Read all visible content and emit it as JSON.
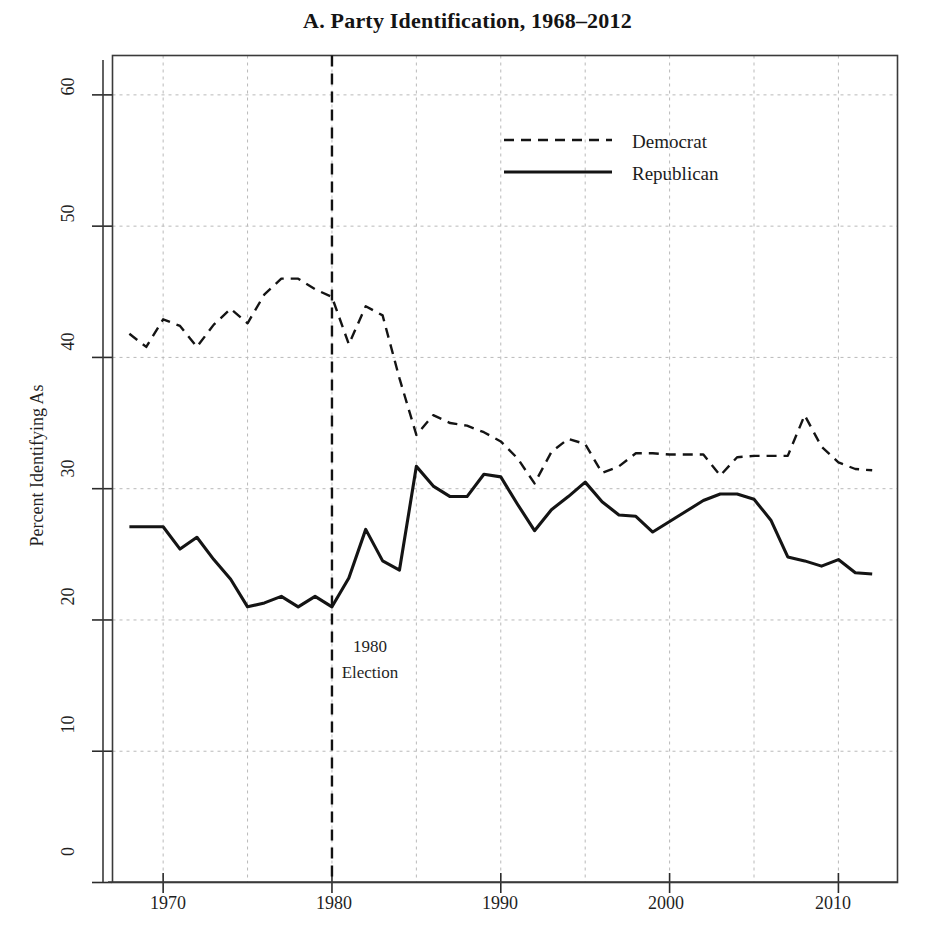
{
  "figure": {
    "title": "A. Party Identification, 1968–2012",
    "background": "#ffffff",
    "ink_color": "#1a1a1a",
    "grid_color": "#b9b9b9"
  },
  "annotation": {
    "line1": "1980",
    "line2": "Election",
    "marker_year": 1980
  },
  "legend": {
    "democrat_label": "Democrat",
    "republican_label": "Republican"
  },
  "axes": {
    "y_title": "Percent Identifying As",
    "y_ticks": [
      "0",
      "10",
      "20",
      "30",
      "40",
      "50",
      "60"
    ],
    "x_ticks": [
      "1970",
      "1980",
      "1990",
      "2000",
      "2010"
    ]
  },
  "chart_data": {
    "type": "line",
    "title": "A. Party Identification, 1968–2012",
    "xlabel": "",
    "ylabel": "Percent Identifying As",
    "xlim": [
      1967,
      2013.5
    ],
    "ylim": [
      0,
      63
    ],
    "y_ticks": [
      0,
      10,
      20,
      30,
      40,
      50,
      60
    ],
    "x_ticks": [
      1970,
      1980,
      1990,
      2000,
      2010
    ],
    "grid": true,
    "grid_x_minor_every": 5,
    "legend_position": "upper-center",
    "annotations": [
      {
        "text": "1980 Election",
        "x": 1980,
        "y": 15,
        "vline": true,
        "vline_style": "dashed",
        "vline_color": "#111111"
      }
    ],
    "x": [
      1968,
      1969,
      1970,
      1971,
      1972,
      1973,
      1974,
      1975,
      1976,
      1977,
      1978,
      1979,
      1980,
      1981,
      1982,
      1983,
      1984,
      1985,
      1986,
      1987,
      1988,
      1989,
      1990,
      1991,
      1992,
      1993,
      1994,
      1995,
      1996,
      1997,
      1998,
      1999,
      2000,
      2001,
      2002,
      2003,
      2004,
      2005,
      2006,
      2007,
      2008,
      2009,
      2010,
      2011,
      2012
    ],
    "series": [
      {
        "name": "Democrat",
        "style": "dashed",
        "color": "#141414",
        "values": [
          41.8,
          40.8,
          42.9,
          42.4,
          40.8,
          42.5,
          43.7,
          42.6,
          44.8,
          46.0,
          46.0,
          45.2,
          44.6,
          41.0,
          43.9,
          43.2,
          38.4,
          34.1,
          35.6,
          35.0,
          34.8,
          34.3,
          33.6,
          32.3,
          30.4,
          32.8,
          33.8,
          33.4,
          31.2,
          31.7,
          32.7,
          32.7,
          32.6,
          32.6,
          32.6,
          31.0,
          32.4,
          32.5,
          32.5,
          32.5,
          35.6,
          33.2,
          32.0,
          31.5,
          31.4
        ]
      },
      {
        "name": "Republican",
        "style": "solid",
        "color": "#141414",
        "values": [
          27.1,
          27.1,
          27.1,
          25.4,
          26.3,
          24.6,
          23.1,
          21.0,
          21.3,
          21.8,
          21.0,
          21.8,
          21.0,
          23.2,
          26.9,
          24.5,
          23.8,
          31.7,
          30.2,
          29.4,
          29.4,
          31.1,
          30.9,
          28.8,
          26.8,
          28.4,
          29.4,
          30.5,
          29.0,
          28.0,
          27.9,
          26.7,
          27.5,
          28.3,
          29.1,
          29.6,
          29.6,
          29.2,
          27.6,
          24.8,
          24.5,
          24.1,
          24.6,
          23.6,
          23.5
        ]
      }
    ]
  }
}
